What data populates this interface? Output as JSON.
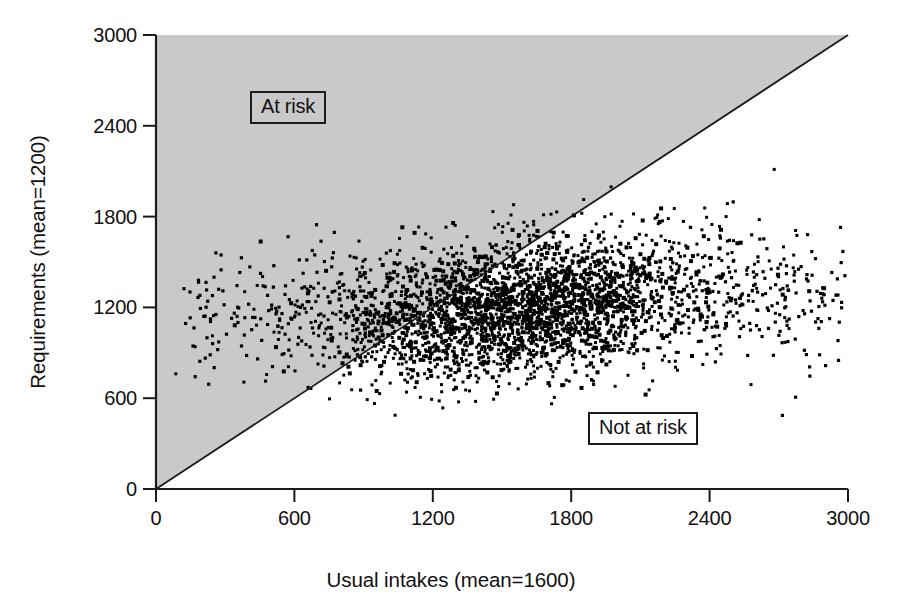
{
  "chart_data": {
    "type": "scatter",
    "title": "",
    "xlabel": "Usual intakes (mean=1600)",
    "ylabel": "Requirements (mean=1200)",
    "xlim": [
      0,
      3000
    ],
    "ylim": [
      0,
      3000
    ],
    "xticks": [
      0,
      600,
      1200,
      1800,
      2400,
      3000
    ],
    "yticks": [
      0,
      600,
      1200,
      1800,
      2400,
      3000
    ],
    "xtick_labels": [
      "0",
      "600",
      "1200",
      "1800",
      "2400",
      "3000"
    ],
    "ytick_labels": [
      "0",
      "600",
      "1200",
      "1800",
      "2400",
      "3000"
    ],
    "grid": false,
    "legend": "none",
    "marker": "square",
    "marker_color": "#000000",
    "marker_size": 3,
    "n_points": 3000,
    "distribution": {
      "x_mean": 1600,
      "x_sd": 420,
      "y_mean": 1200,
      "y_sd": 230,
      "correlation": 0.28
    },
    "reference_line": {
      "name": "identity-line",
      "equation": "y = x",
      "from": [
        0,
        0
      ],
      "to": [
        3000,
        3000
      ],
      "color": "#1a1a1a"
    },
    "shaded_region": {
      "name": "at-risk-region",
      "description": "Region above the identity line where requirements exceed usual intakes",
      "color": "#c9c9c9"
    },
    "annotations": [
      {
        "name": "at-risk",
        "text": "At risk",
        "x": 480,
        "y": 2560
      },
      {
        "name": "not-at-risk",
        "text": "Not at risk",
        "x": 2080,
        "y": 740
      }
    ]
  },
  "axes": {
    "x": {
      "label": "Usual intakes (mean=1600)",
      "ticks": [
        {
          "value": 0,
          "label": "0"
        },
        {
          "value": 600,
          "label": "600"
        },
        {
          "value": 1200,
          "label": "1200"
        },
        {
          "value": 1800,
          "label": "1800"
        },
        {
          "value": 2400,
          "label": "2400"
        },
        {
          "value": 3000,
          "label": "3000"
        }
      ]
    },
    "y": {
      "label": "Requirements (mean=1200)",
      "ticks": [
        {
          "value": 0,
          "label": "0"
        },
        {
          "value": 600,
          "label": "600"
        },
        {
          "value": 1200,
          "label": "1200"
        },
        {
          "value": 1800,
          "label": "1800"
        },
        {
          "value": 2400,
          "label": "2400"
        },
        {
          "value": 3000,
          "label": "3000"
        }
      ]
    }
  },
  "annotations": {
    "at_risk": "At risk",
    "not_at_risk": "Not at risk"
  },
  "colors": {
    "shaded_region": "#c9c9c9",
    "axis": "#1a1a1a",
    "point": "#000000",
    "background": "#ffffff"
  }
}
